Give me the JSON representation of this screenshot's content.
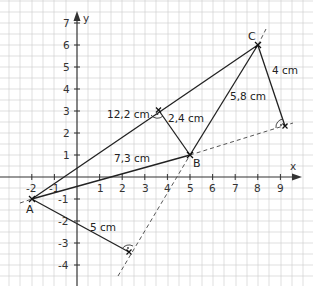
{
  "diagram": {
    "type": "coordinate-geometry",
    "axes": {
      "x_label": "x",
      "y_label": "y",
      "x_ticks": [
        "-2",
        "-1",
        "1",
        "2",
        "3",
        "4",
        "5",
        "6",
        "7",
        "8",
        "9"
      ],
      "y_ticks": [
        "7",
        "6",
        "5",
        "4",
        "3",
        "2",
        "1",
        "-1",
        "-2",
        "-3",
        "-4"
      ]
    },
    "points": {
      "A": {
        "label": "A",
        "x": -2,
        "y": -1
      },
      "B": {
        "label": "B",
        "x": 5,
        "y": 1
      },
      "C": {
        "label": "C",
        "x": 8,
        "y": 6
      }
    },
    "measurements": {
      "ac_length": "12,2 cm",
      "ab_length": "7,3 cm",
      "bc_length": "5,8 cm",
      "height_b": "2,4 cm",
      "height_c": "4 cm",
      "height_a": "5 cm"
    }
  }
}
